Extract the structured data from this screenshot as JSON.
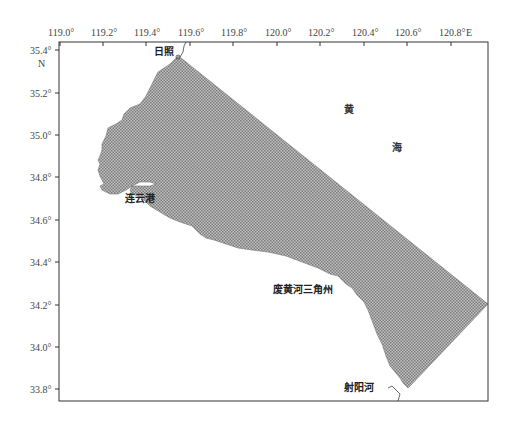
{
  "map": {
    "frame": {
      "left": 59,
      "top": 42,
      "right": 488,
      "bottom": 401
    },
    "x_axis": {
      "unit_label": "E",
      "ticks": [
        {
          "label": "119.0°",
          "x": 60
        },
        {
          "label": "119.2°",
          "x": 103
        },
        {
          "label": "119.4°",
          "x": 146
        },
        {
          "label": "119.6°",
          "x": 190
        },
        {
          "label": "119.8°",
          "x": 233
        },
        {
          "label": "120.0°",
          "x": 277
        },
        {
          "label": "120.2°",
          "x": 320
        },
        {
          "label": "120.4°",
          "x": 364
        },
        {
          "label": "120.6°",
          "x": 407
        },
        {
          "label": "120.8°",
          "x": 451
        }
      ]
    },
    "y_axis": {
      "unit_label": "N",
      "ticks": [
        {
          "label": "35.4°",
          "y": 50
        },
        {
          "label": "35.2°",
          "y": 93
        },
        {
          "label": "35.0°",
          "y": 135
        },
        {
          "label": "34.8°",
          "y": 177
        },
        {
          "label": "34.6°",
          "y": 220
        },
        {
          "label": "34.4°",
          "y": 262
        },
        {
          "label": "34.2°",
          "y": 305
        },
        {
          "label": "34.0°",
          "y": 347
        },
        {
          "label": "33.8°",
          "y": 389
        }
      ]
    },
    "places": {
      "rizhao": "日照",
      "lianyungang": "连云港",
      "feihuanghe": "废黄河三角州",
      "sheyanghe": "射阳河"
    },
    "sea": {
      "char1": "黄",
      "char2": "海"
    },
    "colors": {
      "hatch_fill": "#8a8a8a",
      "hatch_bg": "#c4c4c4",
      "frame": "#333333"
    }
  }
}
